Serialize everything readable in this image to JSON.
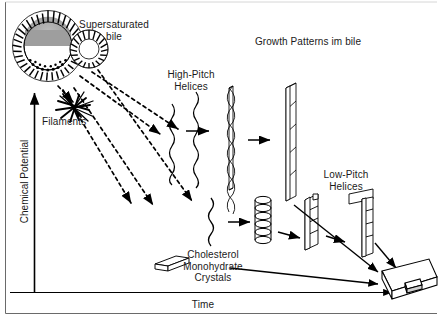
{
  "figure": {
    "title": "Growth Patterns im bile",
    "axes": {
      "x_label": "Time",
      "y_label": "Chemical Potential"
    },
    "labels": {
      "supersaturated_bile": "Supersaturated\nbile",
      "filaments": "Filaments",
      "high_pitch_helices": "High-Pitch\nHelices",
      "low_pitch_helices": "Low-Pitch\nHelices",
      "cholesterol_crystals": "Cholesterol\nMonohydrate\nCrystals"
    },
    "colors": {
      "ink": "#000000",
      "text": "#1a1a1a",
      "vesicle_fill": "#9e9e9e",
      "background": "#ffffff"
    },
    "elements": [
      {
        "name": "large-vesicle",
        "kind": "micelle"
      },
      {
        "name": "small-vesicle",
        "kind": "micelle"
      },
      {
        "name": "filament-burst",
        "kind": "filaments"
      },
      {
        "name": "wavy-filament-upper",
        "kind": "helix"
      },
      {
        "name": "twisted-helix-upper",
        "kind": "helix"
      },
      {
        "name": "wide-ribbon-upper",
        "kind": "ribbon"
      },
      {
        "name": "wavy-filament-lower",
        "kind": "helix"
      },
      {
        "name": "coiled-helix-lower",
        "kind": "helix"
      },
      {
        "name": "ribbon-lower",
        "kind": "ribbon"
      },
      {
        "name": "folded-ribbon-lower",
        "kind": "ribbon"
      },
      {
        "name": "crystal-plate-small",
        "kind": "crystal"
      },
      {
        "name": "crystal-plate-large",
        "kind": "crystal"
      }
    ]
  }
}
